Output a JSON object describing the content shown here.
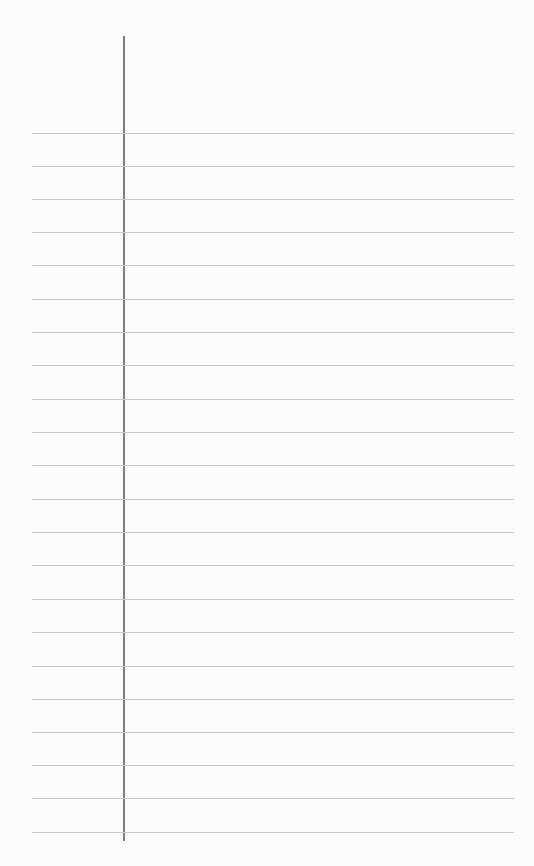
{
  "page": {
    "type": "lined-notebook-paper",
    "colors": {
      "paper": "#fbfbfb",
      "rule": "#c9c9c9",
      "margin": "#7d7d7d"
    },
    "rule_positions": [
      133,
      166,
      199,
      232,
      265,
      299,
      332,
      365,
      399,
      432,
      465,
      499,
      532,
      565,
      599,
      632,
      666,
      699,
      732,
      765,
      798,
      832
    ]
  }
}
